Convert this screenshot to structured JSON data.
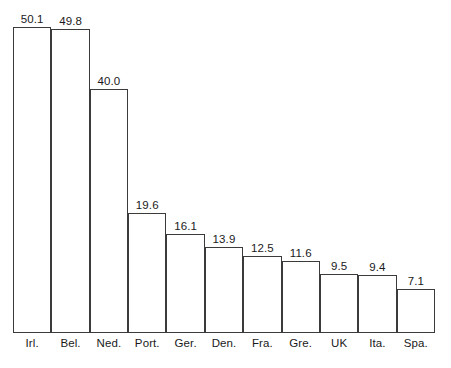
{
  "chart_data": {
    "type": "bar",
    "title": "",
    "subtitle": "",
    "xlabel": "",
    "ylabel": "",
    "categories": [
      "Irl.",
      "Bel.",
      "Ned.",
      "Port.",
      "Ger.",
      "Den.",
      "Fra.",
      "Gre.",
      "UK",
      "Ita.",
      "Spa."
    ],
    "values": [
      50.1,
      49.8,
      40.0,
      19.6,
      16.1,
      13.9,
      12.5,
      11.6,
      9.5,
      9.4,
      7.1
    ],
    "value_labels": [
      "50.1",
      "49.8",
      "40.0",
      "19.6",
      "16.1",
      "13.9",
      "12.5",
      "11.6",
      "9.5",
      "9.4",
      "7.1"
    ],
    "ylim": [
      0,
      50.1
    ],
    "grid": false,
    "legend": false,
    "legend_position": "none",
    "bar_fill_color": "#ffffff",
    "bar_border_color": "#3b3b3b",
    "background_color": "#ffffff",
    "text_color": "#1a1a1a",
    "axis_visible": {
      "x": true,
      "y": false
    },
    "tick_labels_y": []
  },
  "bars": [
    {
      "category": "Irl.",
      "value_label": "50.1"
    },
    {
      "category": "Bel.",
      "value_label": "49.8"
    },
    {
      "category": "Ned.",
      "value_label": "40.0"
    },
    {
      "category": "Port.",
      "value_label": "19.6"
    },
    {
      "category": "Ger.",
      "value_label": "16.1"
    },
    {
      "category": "Den.",
      "value_label": "13.9"
    },
    {
      "category": "Fra.",
      "value_label": "12.5"
    },
    {
      "category": "Gre.",
      "value_label": "11.6"
    },
    {
      "category": "UK",
      "value_label": "9.5"
    },
    {
      "category": "Ita.",
      "value_label": "9.4"
    },
    {
      "category": "Spa.",
      "value_label": "7.1"
    }
  ]
}
